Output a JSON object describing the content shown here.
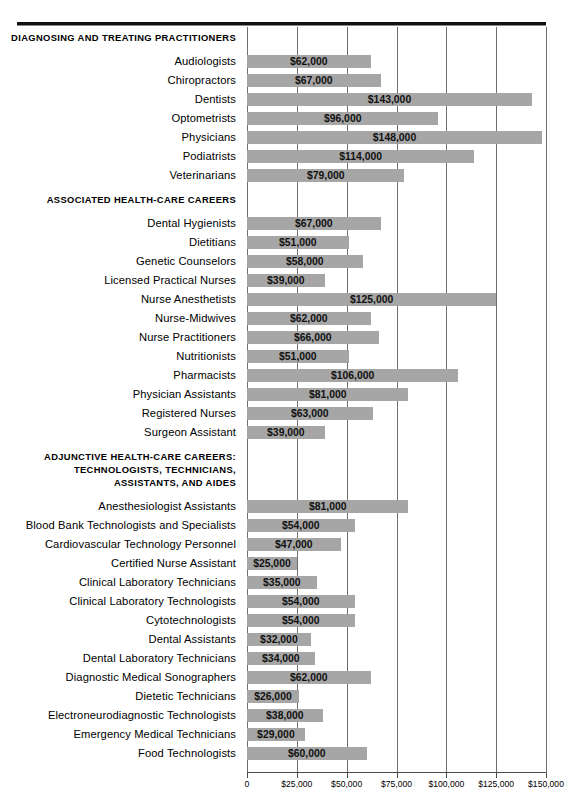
{
  "chart_data": {
    "type": "bar",
    "orientation": "horizontal",
    "title": "",
    "xlabel": "",
    "ylabel": "",
    "xlim": [
      0,
      150000
    ],
    "xticks": [
      0,
      25000,
      50000,
      75000,
      100000,
      125000,
      150000
    ],
    "xtick_labels": [
      "0",
      "$25,000",
      "$50,000",
      "$75,000",
      "$100,000",
      "$125,000",
      "$150,000"
    ],
    "grid": true,
    "legend": "none",
    "bar_color": "#a6a6a6",
    "groups": [
      {
        "heading": [
          "Diagnosing and Treating Practitioners"
        ],
        "categories": [
          "Audiologists",
          "Chiropractors",
          "Dentists",
          "Optometrists",
          "Physicians",
          "Podiatrists",
          "Veterinarians"
        ],
        "values": [
          62000,
          67000,
          143000,
          96000,
          148000,
          114000,
          79000
        ],
        "value_labels": [
          "$62,000",
          "$67,000",
          "$143,000",
          "$96,000",
          "$148,000",
          "$114,000",
          "$79,000"
        ]
      },
      {
        "heading": [
          "Associated Health-Care Careers"
        ],
        "categories": [
          "Dental Hygienists",
          "Dietitians",
          "Genetic Counselors",
          "Licensed Practical Nurses",
          "Nurse Anesthetists",
          "Nurse-Midwives",
          "Nurse Practitioners",
          "Nutritionists",
          "Pharmacists",
          "Physician Assistants",
          "Registered Nurses",
          "Surgeon Assistant"
        ],
        "values": [
          67000,
          51000,
          58000,
          39000,
          125000,
          62000,
          66000,
          51000,
          106000,
          81000,
          63000,
          39000
        ],
        "value_labels": [
          "$67,000",
          "$51,000",
          "$58,000",
          "$39,000",
          "$125,000",
          "$62,000",
          "$66,000",
          "$51,000",
          "$106,000",
          "$81,000",
          "$63,000",
          "$39,000"
        ]
      },
      {
        "heading": [
          "Adjunctive Health-Care Careers:",
          "Technologists, Technicians,",
          "Assistants, and Aides"
        ],
        "categories": [
          "Anesthesiologist Assistants",
          "Blood Bank Technologists and Specialists",
          "Cardiovascular Technology Personnel",
          "Certified Nurse Assistant",
          "Clinical Laboratory Technicians",
          "Clinical Laboratory Technologists",
          "Cytotechnologists",
          "Dental Assistants",
          "Dental Laboratory Technicians",
          "Diagnostic Medical Sonographers",
          "Dietetic Technicians",
          "Electroneurodiagnostic Technologists",
          "Emergency Medical Technicians",
          "Food Technologists"
        ],
        "values": [
          81000,
          54000,
          47000,
          25000,
          35000,
          54000,
          54000,
          32000,
          34000,
          62000,
          26000,
          38000,
          29000,
          60000
        ],
        "value_labels": [
          "$81,000",
          "$54,000",
          "$47,000",
          "$25,000",
          "$35,000",
          "$54,000",
          "$54,000",
          "$32,000",
          "$34,000",
          "$62,000",
          "$26,000",
          "$38,000",
          "$29,000",
          "$60,000"
        ]
      }
    ]
  }
}
